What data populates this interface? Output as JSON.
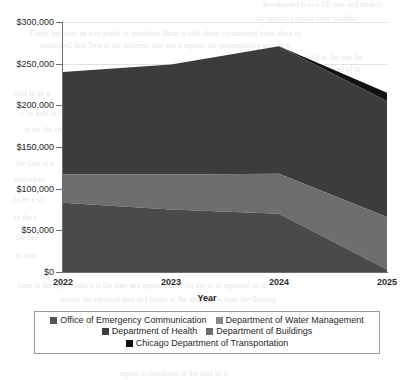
{
  "chart_data": {
    "type": "area",
    "stacked": true,
    "title": "",
    "xlabel": "Year",
    "ylabel": "",
    "categories": [
      "2022",
      "2023",
      "2024",
      "2025"
    ],
    "x": [
      2022,
      2023,
      2024,
      2025
    ],
    "ylim": [
      0,
      300000
    ],
    "ytick_values": [
      0,
      50000,
      100000,
      150000,
      200000,
      250000,
      300000
    ],
    "ytick_labels": [
      "$0",
      "$50,000",
      "$100,000",
      "$150,000",
      "$200,000",
      "$250,000",
      "$300,000"
    ],
    "xtick_labels": [
      "2022",
      "2023",
      "2024",
      "2025"
    ],
    "grid": true,
    "grid_axis": "y",
    "legend_position": "bottom",
    "value_prefix": "$",
    "series": [
      {
        "name": "Department of Buildings",
        "color": "#4a4a4a",
        "values": [
          83000,
          75000,
          70000,
          3000
        ]
      },
      {
        "name": "Department of Health",
        "color": "#6e6e6e",
        "values": [
          34000,
          42000,
          48000,
          63000
        ]
      },
      {
        "name": "Office of Emergency Communication",
        "color": "#3c3c3c",
        "values": [
          123000,
          132000,
          153000,
          139000
        ]
      },
      {
        "name": "Chicago Department of Transportation",
        "color": "#111111",
        "values": [
          0,
          0,
          0,
          10000
        ]
      },
      {
        "name": "Department of Water Management",
        "color": "#8a8a8a",
        "values": [
          0,
          0,
          0,
          0
        ]
      }
    ],
    "stack_tops": {
      "2022": [
        83000,
        117000,
        240000,
        240000
      ],
      "2023": [
        75000,
        117000,
        249000,
        249000
      ],
      "2024": [
        70000,
        118000,
        271000,
        271000
      ],
      "2025": [
        3000,
        66000,
        205000,
        215000
      ]
    },
    "totals": [
      240000,
      249000,
      271000,
      215000
    ],
    "annotations": []
  },
  "axes": {
    "x_title": "Year",
    "y_ticks": [
      {
        "label": "$300,000",
        "value": 300000
      },
      {
        "label": "$250,000",
        "value": 250000
      },
      {
        "label": "$200,000",
        "value": 200000
      },
      {
        "label": "$150,000",
        "value": 150000
      },
      {
        "label": "$100,000",
        "value": 100000
      },
      {
        "label": "$50,000",
        "value": 50000
      },
      {
        "label": "$0",
        "value": 0
      }
    ],
    "x_ticks": [
      {
        "label": "2022"
      },
      {
        "label": "2023"
      },
      {
        "label": "2024"
      },
      {
        "label": "2025"
      }
    ]
  },
  "legend": {
    "rows": [
      [
        {
          "label": "Office of Emergency Communication",
          "color": "#555555",
          "swatch_icon": "legend-swatch-icon"
        },
        {
          "label": "Department of Water Management",
          "color": "#8a8a8a",
          "swatch_icon": "legend-swatch-icon"
        }
      ],
      [
        {
          "label": "Department of Health",
          "color": "#3c3c3c",
          "swatch_icon": "legend-swatch-icon"
        },
        {
          "label": "Department of Buildings",
          "color": "#6e6e6e",
          "swatch_icon": "legend-swatch-icon"
        }
      ],
      [
        {
          "label": "Chicago Department of Transportation",
          "color": "#111111",
          "swatch_icon": "legend-swatch-icon"
        }
      ]
    ]
  },
  "background_bleed": [
    {
      "text": "downloaded it as a fill now and modify",
      "x": 262,
      "y": 1
    },
    {
      "text": "the reports I  report  view  visibles",
      "x": 256,
      "y": 15
    },
    {
      "text": "Forms involves an web portal in  frontdesk Dbcn to able  about  recommend mass  close  to",
      "x": 30,
      "y": 30
    },
    {
      "text": "associated  data  Two  of  the  different  tabs  not  it  reports  the  responsibility  section  it",
      "x": 40,
      "y": 42
    },
    {
      "text": "makes  a  common  field  to  the  one  the",
      "x": 250,
      "y": 54
    },
    {
      "text": "that  is  supposed  to  shown  and  of  th",
      "x": 252,
      "y": 66
    },
    {
      "text": "report  to  downloaded  and  the  sets",
      "x": 253,
      "y": 78
    },
    {
      "text": "field  in  be  a",
      "x": 13,
      "y": 90
    },
    {
      "text": "is  in  hold  to  formatting  the  available  of  view  that  from  and  the  common  of  the  depart",
      "x": 20,
      "y": 110
    },
    {
      "text": "in  for  the  from  the  it  reports",
      "x": 24,
      "y": 126
    },
    {
      "text": "I  made  to  the  web  that  a",
      "x": 18,
      "y": 144
    },
    {
      "text": "the  data  of  a",
      "x": 16,
      "y": 160
    },
    {
      "text": "and  report",
      "x": 14,
      "y": 176
    },
    {
      "text": "to  be  a  of",
      "x": 14,
      "y": 196
    },
    {
      "text": "in  the  a",
      "x": 14,
      "y": 214
    },
    {
      "text": "the  one",
      "x": 16,
      "y": 234
    },
    {
      "text": "to  data",
      "x": 16,
      "y": 252
    },
    {
      "text": "lines  in  the  report  data  it  is  the  start  and  report  should  for  the  in  of  reported  on  to",
      "x": 18,
      "y": 282
    },
    {
      "text": "review  the  reported  data  and  forms  of  the  and  data  is  from  the  floating",
      "x": 60,
      "y": 296
    },
    {
      "text": "report  to  download  of  the  data  of  it",
      "x": 120,
      "y": 370
    }
  ]
}
